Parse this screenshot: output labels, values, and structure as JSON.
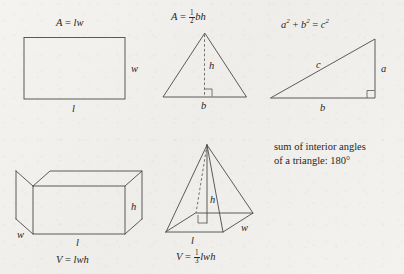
{
  "page": {
    "kind": "geometry-formula-reference",
    "background_color": "#f2f1ee",
    "ink_color": "#2b2b2b",
    "line_color": "#4a4a4a"
  },
  "figures": {
    "rectangle": {
      "name": "rectangle",
      "formula_plain": "A = lw",
      "formula_parts": {
        "lhs": "A",
        "eq": "=",
        "rhs_1": "l",
        "rhs_2": "w"
      },
      "labels": {
        "width": "w",
        "length": "l"
      }
    },
    "triangle": {
      "name": "triangle",
      "formula_plain": "A = 1/2 bh",
      "formula_parts": {
        "lhs": "A",
        "eq": "=",
        "num": "1",
        "den": "2",
        "rhs_1": "b",
        "rhs_2": "h"
      },
      "labels": {
        "height": "h",
        "base": "b"
      },
      "has_right_angle_marker": true,
      "has_dashed_height": true
    },
    "right_triangle": {
      "name": "right-triangle",
      "formula_plain": "a2 + b2 = c2",
      "formula_parts": {
        "a": "a",
        "a_exp": "2",
        "plus": "+",
        "b": "b",
        "b_exp": "2",
        "eq": "=",
        "c": "c",
        "c_exp": "2"
      },
      "labels": {
        "hypotenuse": "c",
        "vertical": "a",
        "base": "b"
      },
      "has_right_angle_marker": true
    },
    "box": {
      "name": "rectangular-prism",
      "formula_plain": "V = lwh",
      "formula_parts": {
        "lhs": "V",
        "eq": "=",
        "rhs_1": "l",
        "rhs_2": "w",
        "rhs_3": "h"
      },
      "labels": {
        "height": "h",
        "length": "l",
        "width": "w"
      }
    },
    "pyramid": {
      "name": "rectangular-pyramid",
      "formula_plain": "V = 1/3 lwh",
      "formula_parts": {
        "lhs": "V",
        "eq": "=",
        "num": "1",
        "den": "3",
        "rhs_1": "l",
        "rhs_2": "w",
        "rhs_3": "h"
      },
      "labels": {
        "height": "h",
        "length": "l",
        "width": "w"
      },
      "has_right_angle_marker": true,
      "has_dashed_edge": true
    }
  },
  "note": {
    "line_1": "sum of interior angles",
    "line_2": "of a triangle: 180°"
  }
}
